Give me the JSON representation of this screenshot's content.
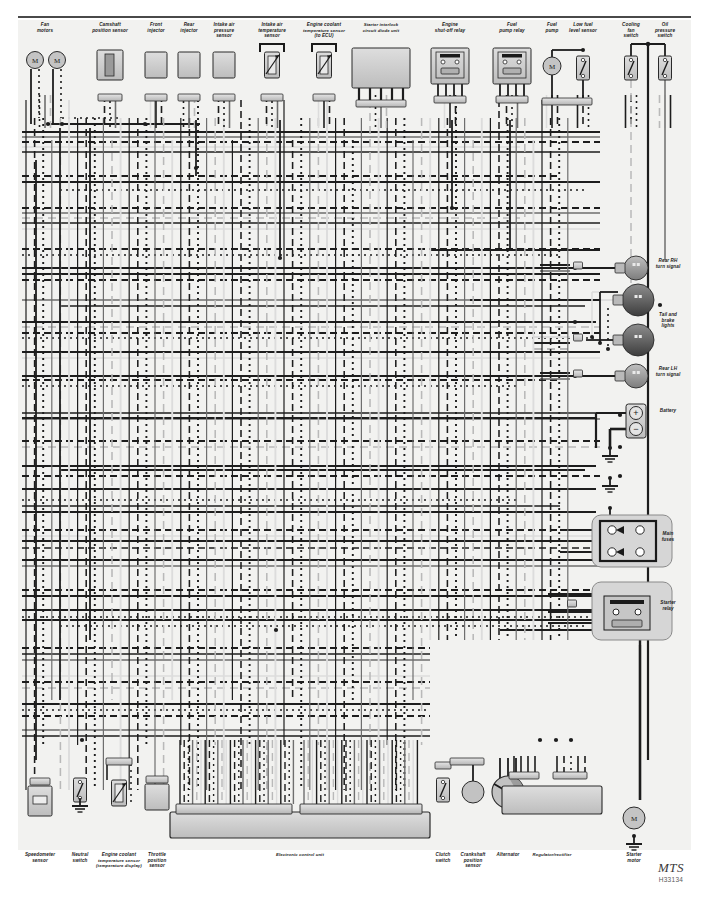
{
  "sheet": {
    "width": 709,
    "height": 909,
    "background": "#ffffff",
    "field_background": "#f2f2f0",
    "rule_color": "#4a4a4a",
    "title_watermark": "MTS",
    "code_watermark": "H33134"
  },
  "palette": {
    "wire_dark": "#1d1d1d",
    "wire_mid": "#6e6e6e",
    "wire_light": "#b9b9b9",
    "wire_pale": "#dcdcdc",
    "box_fill": "#c9c9c9",
    "box_fill_light": "#d8d8d8",
    "box_stroke": "#2a2a2a",
    "lamp_dark": "#4a4a4a",
    "lamp_mid": "#8d8d8d",
    "label_color": "#1a1a1a"
  },
  "top_components": [
    {
      "id": "fan-motors",
      "label": "Fan\nmotors",
      "x": 45,
      "type": "motor-pair"
    },
    {
      "id": "camshaft-position-sensor",
      "label": "Camshaft\nposition sensor",
      "x": 110,
      "type": "sensor-block"
    },
    {
      "id": "front-injector",
      "label": "Front\ninjector",
      "x": 156,
      "type": "injector"
    },
    {
      "id": "rear-injector",
      "label": "Rear\ninjector",
      "x": 189,
      "type": "injector"
    },
    {
      "id": "intake-air-pressure-sensor",
      "label": "Intake air\npressure\nsensor",
      "x": 224,
      "type": "injector"
    },
    {
      "id": "intake-air-temperature-sensor",
      "label": "Intake air\ntemperature\nsensor",
      "x": 272,
      "type": "thermistor"
    },
    {
      "id": "engine-coolant-temperature-sensor-ecu",
      "label": "Engine coolant\ntemperature sensor\n(to ECU)",
      "x": 324,
      "type": "thermistor"
    },
    {
      "id": "starter-interlock-circuit-diode-unit",
      "label": "Starter interlock\ncircuit diode unit",
      "x": 381,
      "type": "diode-unit"
    },
    {
      "id": "engine-shut-off-relay",
      "label": "Engine\nshut-off relay",
      "x": 450,
      "type": "relay"
    },
    {
      "id": "fuel-pump-relay",
      "label": "Fuel\npump relay",
      "x": 512,
      "type": "relay"
    },
    {
      "id": "fuel-pump",
      "label": "Fuel\npump",
      "x": 552,
      "type": "motor"
    },
    {
      "id": "low-fuel-level-sensor",
      "label": "Low fuel\nlevel sensor",
      "x": 583,
      "type": "switch"
    },
    {
      "id": "cooling-fan-switch",
      "label": "Cooling\nfan\nswitch",
      "x": 631,
      "type": "switch"
    },
    {
      "id": "oil-pressure-switch",
      "label": "Oil\npressure\nswitch",
      "x": 665,
      "type": "switch"
    }
  ],
  "right_components": [
    {
      "id": "rear-rh-turn-signal",
      "label": "Rear RH\nturn signal",
      "y": 268,
      "type": "lamp-single"
    },
    {
      "id": "tail-and-brake-lights",
      "label": "Tail and\nbrake\nlights",
      "y": 322,
      "type": "lamp-double"
    },
    {
      "id": "rear-lh-turn-signal",
      "label": "Rear LH\nturn signal",
      "y": 376,
      "type": "lamp-single"
    },
    {
      "id": "battery",
      "label": "Battery",
      "y": 418,
      "type": "battery"
    },
    {
      "id": "main-fuses",
      "label": "Main\nfuses",
      "y": 541,
      "type": "fusebox"
    },
    {
      "id": "starter-relay",
      "label": "Starter\nrelay",
      "y": 610,
      "type": "starter-relay"
    }
  ],
  "bottom_components": [
    {
      "id": "speedometer-sensor",
      "label": "Speedometer\nsensor",
      "x": 40,
      "type": "speedo"
    },
    {
      "id": "neutral-switch",
      "label": "Neutral\nswitch",
      "x": 80,
      "type": "switch-gnd"
    },
    {
      "id": "engine-coolant-temperature-sensor-display",
      "label": "Engine coolant\ntemperature sensor\n(temperature display)",
      "x": 119,
      "type": "thermistor"
    },
    {
      "id": "throttle-position-sensor",
      "label": "Throttle\nposition\nsensor",
      "x": 157,
      "type": "tps"
    },
    {
      "id": "electronic-control-unit",
      "label": "Electronic control unit",
      "x": 300,
      "type": "ecu"
    },
    {
      "id": "clutch-switch",
      "label": "Clutch\nswitch",
      "x": 443,
      "type": "switch"
    },
    {
      "id": "crankshaft-position-sensor",
      "label": "Crankshaft\nposition\nsensor",
      "x": 473,
      "type": "pickup"
    },
    {
      "id": "alternator",
      "label": "Alternator",
      "x": 508,
      "type": "alternator"
    },
    {
      "id": "regulator-rectifier",
      "label": "Regulator/rectifier",
      "x": 552,
      "type": "regulator"
    },
    {
      "id": "starter-motor",
      "label": "Starter\nmotor",
      "x": 634,
      "type": "motor-gnd"
    }
  ],
  "symbols": {
    "motor_glyph": "M",
    "battery_positive": "+",
    "battery_negative": "−"
  },
  "wire_styles": [
    {
      "name": "solid-dark",
      "color": "#1d1d1d",
      "dash": "none"
    },
    {
      "name": "dashed-dark",
      "color": "#1d1d1d",
      "dash": "7 4"
    },
    {
      "name": "dotted-dark",
      "color": "#1d1d1d",
      "dash": "2 4"
    },
    {
      "name": "solid-mid",
      "color": "#6e6e6e",
      "dash": "none"
    },
    {
      "name": "dashed-light",
      "color": "#b9b9b9",
      "dash": "8 5"
    },
    {
      "name": "solid-pale",
      "color": "#dcdcdc",
      "dash": "none"
    }
  ]
}
